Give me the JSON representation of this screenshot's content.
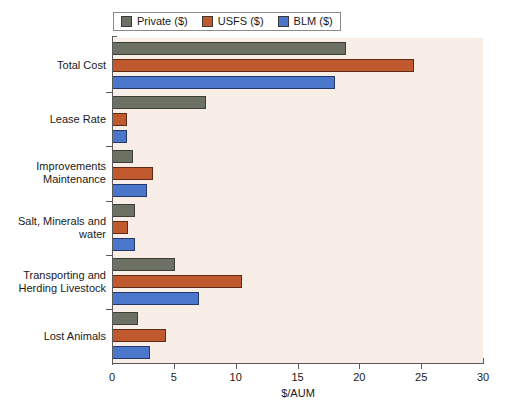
{
  "chart_data": {
    "type": "bar",
    "orientation": "horizontal",
    "title": "",
    "subtitle": "",
    "xlabel": "$/AUM",
    "ylabel": "",
    "xlim": [
      0,
      30
    ],
    "xticks": [
      0,
      5,
      10,
      15,
      20,
      25,
      30
    ],
    "xtick_labels": [
      "0",
      "5",
      "10",
      "15",
      "20",
      "25",
      "30"
    ],
    "grid": false,
    "legend_position": "top",
    "categories": [
      "Total Cost",
      "Lease Rate",
      "Improvements Maintenance",
      "Salt, Minerals and water",
      "Transporting and Herding Livestock",
      "Lost Animals"
    ],
    "category_label_lines": [
      [
        "Total Cost"
      ],
      [
        "Lease Rate"
      ],
      [
        "Improvements",
        "Maintenance"
      ],
      [
        "Salt, Minerals and",
        "water"
      ],
      [
        "Transporting and",
        "Herding Livestock"
      ],
      [
        "Lost Animals"
      ]
    ],
    "series": [
      {
        "name": "Private ($)",
        "color": "#6d7164",
        "values": [
          18.9,
          7.6,
          1.7,
          1.9,
          5.1,
          2.1
        ]
      },
      {
        "name": "USFS ($)",
        "color": "#c05a2e",
        "values": [
          24.4,
          1.2,
          3.3,
          1.3,
          10.5,
          4.4
        ]
      },
      {
        "name": "BLM ($)",
        "color": "#4a77c9",
        "values": [
          18.0,
          1.2,
          2.8,
          1.9,
          7.0,
          3.1
        ]
      }
    ]
  },
  "legend": {
    "entries": [
      {
        "label": "Private ($)",
        "color": "#6d7164"
      },
      {
        "label": "USFS ($)",
        "color": "#c05a2e"
      },
      {
        "label": "BLM ($)",
        "color": "#4a77c9"
      }
    ]
  },
  "axes": {
    "x_title": "$/AUM",
    "x_tick_labels": [
      "0",
      "5",
      "10",
      "15",
      "20",
      "25",
      "30"
    ]
  },
  "colors": {
    "plot_background": "#f8eee7",
    "page_background": "#ffffff",
    "axis": "#5a5a5a",
    "text": "#1a1a1a",
    "private": "#6d7164",
    "usfs": "#c05a2e",
    "blm": "#4a77c9"
  }
}
